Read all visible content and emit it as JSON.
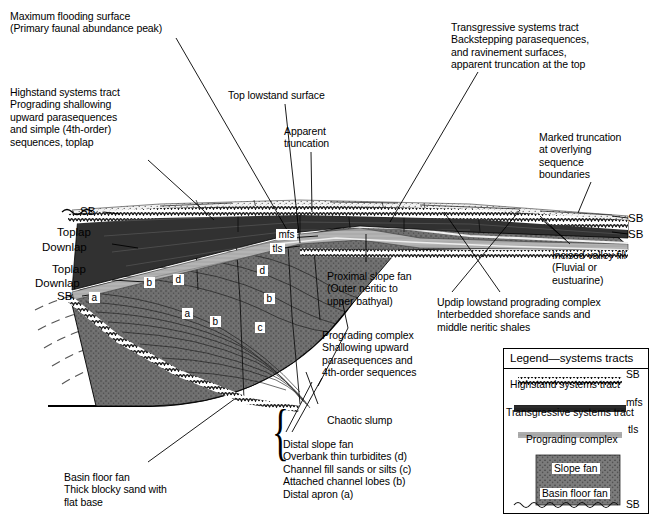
{
  "figure": {
    "kind": "sequence-stratigraphy-cross-section"
  },
  "annotations": {
    "max_flooding_surface": "Maximum flooding surface\n(Primary faunal abundance peak)",
    "highstand_systems_tract": "Highstand systems tract\nPrograding shallowing\nupward parasequences\nand simple (4th-order)\nsequences, toplap",
    "top_lowstand_surface": "Top lowstand surface",
    "apparent_truncation": "Apparent\ntruncation",
    "transgressive_systems_tract": "Transgressive systems tract\nBackstepping parasequences,\nand ravinement surfaces,\napparent truncation at the top",
    "marked_truncation": "Marked truncation\nat overlying\nsequence\nboundaries",
    "incised_valley_fill": "Incised valley fill\n(Fluvial or\neustuarine)",
    "updip_lowstand": "Updip lowstand prograding complex\nInterbedded shoreface sands and\nmiddle neritic shales",
    "proximal_slope_fan": "Proximal slope fan\n(Outer neritic to\nupper bathyal)",
    "prograding_complex": "Prograding complex\nShallowing upward\nparasequences and\n4th-order sequences",
    "chaotic_slump": "Chaotic slump",
    "distal_slope_fan": "Distal slope fan\nOverbank thin turbidites (d)\nChannel fill sands or silts (c)\nAttached channel lobes (b)\nDistal apron (a)",
    "basin_floor_fan": "Basin floor fan\nThick blocky sand with\nflat base"
  },
  "strat_labels": {
    "sb_top_left": "SB",
    "toplap_1": "Toplap",
    "downlap_1": "Downlap",
    "toplap_2": "Toplap",
    "downlap_2": "Downlap",
    "sb_left_low": "SB",
    "sb_right_upper": "SB",
    "sb_right_lower": "SB",
    "mfs": "mfs",
    "tls": "tls"
  },
  "facies_chips": [
    {
      "label": "b",
      "x": 144,
      "y": 277
    },
    {
      "label": "d",
      "x": 173,
      "y": 274
    },
    {
      "label": "a",
      "x": 182,
      "y": 308
    },
    {
      "label": "b",
      "x": 210,
      "y": 316
    },
    {
      "label": "d",
      "x": 257,
      "y": 265
    },
    {
      "label": "b",
      "x": 264,
      "y": 293
    },
    {
      "label": "c",
      "x": 255,
      "y": 322
    },
    {
      "label": "a",
      "x": 89,
      "y": 292
    }
  ],
  "legend": {
    "title": "Legend—systems tracts",
    "rows": [
      {
        "code": "SB",
        "text": "Highstand systems tract"
      },
      {
        "code": "mfs",
        "text": "Transgressive systems tract"
      },
      {
        "code": "tls",
        "text": "Prograding complex"
      }
    ],
    "slope_fan": "Slope fan",
    "basin_floor_fan": "Basin floor fan",
    "sb_bottom": "SB"
  },
  "colors": {
    "ink": "#000000",
    "paper": "#ffffff",
    "hst_dark": "#2b2b2b",
    "tst_mid": "#b0b0b0",
    "prograding": "#6e6e6e",
    "slope_fan": "#8a8a8a",
    "basin_fan": "#6a6a6a"
  }
}
